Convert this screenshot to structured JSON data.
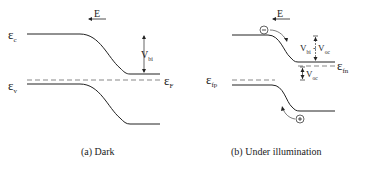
{
  "panels": [
    {
      "id": "a",
      "caption": "(a) Dark",
      "field_label": "E",
      "labels": {
        "ec": "ε",
        "ec_sub": "c",
        "ev": "ε",
        "ev_sub": "v",
        "ef": "ε",
        "ef_sub": "F",
        "vbi": "V",
        "vbi_sub": "bi"
      }
    },
    {
      "id": "b",
      "caption": "(b) Under illumination",
      "field_label": "E",
      "labels": {
        "efn": "ε",
        "efn_sub": "fn",
        "efp": "ε",
        "efp_sub": "fp",
        "vbi_voc": "V",
        "vbi_voc_sub": "bi",
        "vbi_voc_rest": " - V",
        "vbi_voc_sub2": "oc",
        "voc": "V",
        "voc_sub": "oc",
        "electron": "−",
        "hole": "+"
      }
    }
  ]
}
